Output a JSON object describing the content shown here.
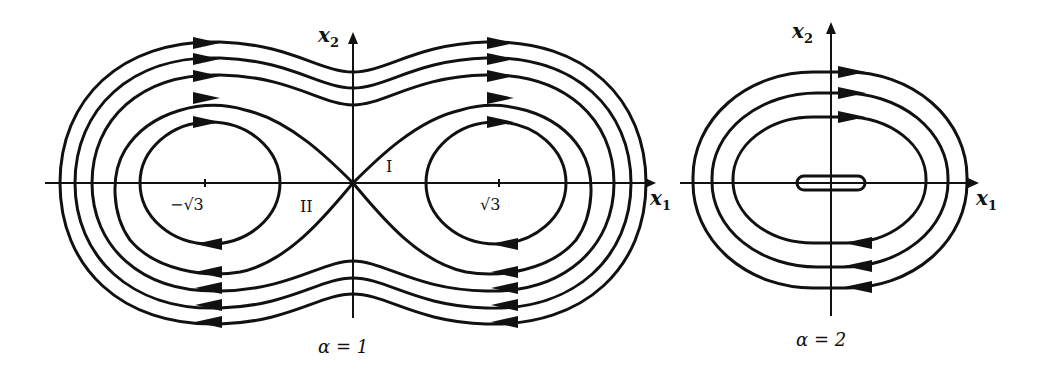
{
  "figure": {
    "panels": [
      {
        "id": "alpha1",
        "caption": "α = 1",
        "x_axis_label": "x",
        "x_axis_sub": "1",
        "y_axis_label": "x",
        "y_axis_sub": "2",
        "tick_left": "−√3",
        "tick_right": "√3",
        "region_I": "I",
        "region_II": "II"
      },
      {
        "id": "alpha2",
        "caption": "α = 2",
        "x_axis_label": "x",
        "x_axis_sub": "1",
        "y_axis_label": "x",
        "y_axis_sub": "2"
      }
    ],
    "colors": {
      "ink": "#111111",
      "background": "#ffffff"
    }
  }
}
